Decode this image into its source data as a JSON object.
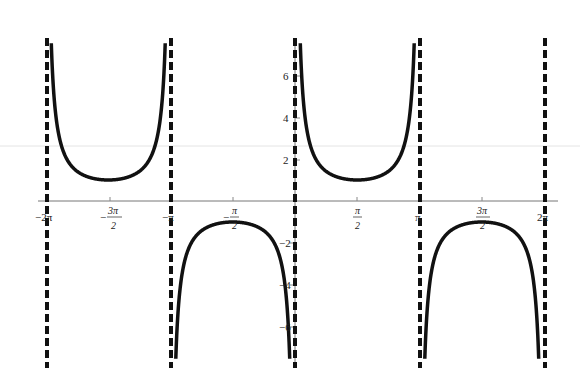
{
  "chart_data": {
    "type": "line",
    "title": "",
    "function": "y = csc x",
    "xlabel": "",
    "ylabel": "",
    "xlim": [
      -6.283,
      6.283
    ],
    "ylim": [
      -7.7,
      7.7
    ],
    "grid": false,
    "legend": null,
    "x_ticks": [
      {
        "value": -6.2832,
        "label": "-2π"
      },
      {
        "value": -4.7124,
        "label_num": "3π",
        "label_den": "2",
        "sign": "−"
      },
      {
        "value": -3.1416,
        "label": "-π"
      },
      {
        "value": -1.5708,
        "label_num": "π",
        "label_den": "2",
        "sign": "−"
      },
      {
        "value": 1.5708,
        "label_num": "π",
        "label_den": "2",
        "sign": ""
      },
      {
        "value": 3.1416,
        "label": "π"
      },
      {
        "value": 4.7124,
        "label_num": "3π",
        "label_den": "2",
        "sign": ""
      },
      {
        "value": 6.2832,
        "label": "2π"
      }
    ],
    "y_ticks": [
      {
        "value": 6,
        "label": "6"
      },
      {
        "value": 4,
        "label": "4"
      },
      {
        "value": 2,
        "label": "2"
      },
      {
        "value": -2,
        "label": "-2"
      },
      {
        "value": -4,
        "label": "-4"
      },
      {
        "value": -6,
        "label": "-6"
      }
    ],
    "asymptotes": [
      -6.2832,
      -3.1416,
      0,
      3.1416,
      6.2832
    ],
    "series": [
      {
        "name": "branch (-2π,-π)",
        "min_point": {
          "x": -4.7124,
          "y": 1
        },
        "sign": 1
      },
      {
        "name": "branch (-π,0)",
        "max_point": {
          "x": -1.5708,
          "y": -1
        },
        "sign": -1
      },
      {
        "name": "branch (0,π)",
        "min_point": {
          "x": 1.5708,
          "y": 1
        },
        "sign": 1
      },
      {
        "name": "branch (π,2π)",
        "max_point": {
          "x": 4.7124,
          "y": -1
        },
        "sign": -1
      }
    ],
    "style": {
      "curve_color": "#111111",
      "asymptote_color": "#111111",
      "axis_color": "#777777",
      "background": "#ffffff"
    }
  },
  "labels": {
    "x_neg2pi": "−2π",
    "x_negpi": "−π",
    "x_pi": "π",
    "x_2pi": "2π",
    "pi": "π",
    "three_pi": "3π",
    "two": "2",
    "minus": "−",
    "y6": "6",
    "y4": "4",
    "y2": "2",
    "yn2": "−2",
    "yn4": "−4",
    "yn6": "−6"
  }
}
